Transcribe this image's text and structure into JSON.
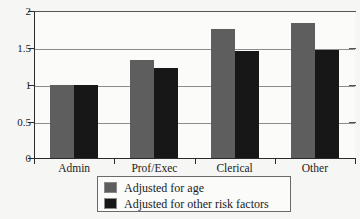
{
  "chart_data": {
    "type": "bar",
    "title": "",
    "subtitle": "",
    "xlabel": "",
    "ylabel": "",
    "categories": [
      "Admin",
      "Prof/Exec",
      "Clerical",
      "Other"
    ],
    "series": [
      {
        "name": "Adjusted for age",
        "color": "#5e5e5e",
        "values": [
          1.0,
          1.33,
          1.75,
          1.84
        ]
      },
      {
        "name": "Adjusted for other risk factors",
        "color": "#171717",
        "values": [
          1.0,
          1.22,
          1.46,
          1.47
        ]
      }
    ],
    "ylim": [
      0,
      2
    ],
    "yticks": [
      0,
      0.5,
      1,
      1.5,
      2
    ],
    "ytick_labels": [
      "0",
      "0.5",
      "1",
      "1.5",
      "2"
    ],
    "grid": true,
    "grid_axis": "y",
    "legend_position": "bottom-center",
    "annotations": []
  },
  "colors": {
    "background": "#f6f6f4",
    "plot_background": "#fbfbfa",
    "axis": "#2b2b2b",
    "gridline": "#8d8d8d",
    "series_age": "#5e5e5e",
    "series_risk": "#171717"
  }
}
